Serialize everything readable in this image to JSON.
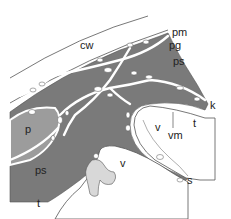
{
  "diagram": {
    "type": "histological schematic",
    "colors": {
      "background": "#ffffff",
      "tissue": "#7a7a7a",
      "tissue_light": "#9c9c9c",
      "stipple": "#d8d8d8",
      "line": "#555555",
      "vessel": "#ffffff"
    },
    "labels": [
      {
        "id": "cw",
        "text": "cw",
        "x": 80,
        "y": 40
      },
      {
        "id": "pm",
        "text": "pm",
        "x": 172,
        "y": 27
      },
      {
        "id": "pg",
        "text": "pg",
        "x": 169,
        "y": 40
      },
      {
        "id": "ps-top",
        "text": "ps",
        "x": 173,
        "y": 56
      },
      {
        "id": "k",
        "text": "k",
        "x": 210,
        "y": 100
      },
      {
        "id": "p",
        "text": "p",
        "x": 25,
        "y": 124
      },
      {
        "id": "v-right",
        "text": "v",
        "x": 155,
        "y": 122
      },
      {
        "id": "t-right",
        "text": "t",
        "x": 193,
        "y": 118
      },
      {
        "id": "vm",
        "text": "vm",
        "x": 168,
        "y": 130
      },
      {
        "id": "v-center",
        "text": "v",
        "x": 120,
        "y": 158
      },
      {
        "id": "ps-bottom",
        "text": "ps",
        "x": 35,
        "y": 165
      },
      {
        "id": "s",
        "text": "s",
        "x": 187,
        "y": 175
      },
      {
        "id": "t-bottom",
        "text": "t",
        "x": 37,
        "y": 198
      }
    ]
  }
}
